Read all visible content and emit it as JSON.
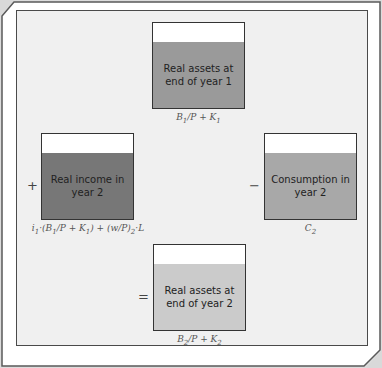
{
  "diagram": {
    "boxes": [
      {
        "id": "assets_year1",
        "text": "Real assets at end of year 1",
        "label": "B1/P + K1",
        "color": "#9a9a9a"
      },
      {
        "id": "income_year2",
        "text": "Real income in year 2",
        "label": "i1·(B1/P + K1) + (w/P)2·L",
        "color": "#777777"
      },
      {
        "id": "consumption_year2",
        "text": "Consumption in year 2",
        "label": "C2",
        "color": "#a8a8a8"
      },
      {
        "id": "assets_year2",
        "text": "Real assets at end of year 2",
        "label": "B2/P + K2",
        "color": "#cbcbcb"
      }
    ],
    "operators": {
      "plus": "+",
      "minus": "−",
      "equals": "="
    }
  }
}
